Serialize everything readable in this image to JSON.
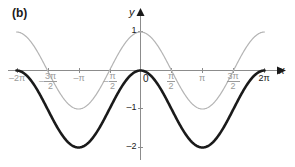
{
  "figure": {
    "panel_label": "(b)",
    "x_axis_label": "x",
    "y_axis_label": "y"
  },
  "chart_data": {
    "type": "line",
    "title": "",
    "xlabel": "x",
    "ylabel": "y",
    "xlim": [
      -7.2,
      7.6
    ],
    "ylim": [
      -2.35,
      1.35
    ],
    "grid": false,
    "legend": "none",
    "x_tick_labels": [
      "-2π",
      "-3π/2",
      "-π",
      "-π/2",
      "0",
      "π/2",
      "π",
      "3π/2",
      "2π"
    ],
    "x_tick_values": [
      -6.283,
      -4.712,
      -3.142,
      -1.571,
      0,
      1.571,
      3.142,
      4.712,
      6.283
    ],
    "y_tick_labels": [
      "1",
      "-1",
      "-2"
    ],
    "y_tick_values": [
      1,
      -1,
      -2
    ],
    "series": [
      {
        "name": "y = cos x",
        "color": "#b4b4b4",
        "width": 1.2,
        "style": "solid",
        "formula": "cos",
        "amplitude": 1,
        "offset": 0,
        "x": [
          -6.283,
          -5.498,
          -4.712,
          -3.927,
          -3.142,
          -2.356,
          -1.571,
          -0.785,
          0,
          0.785,
          1.571,
          2.356,
          3.142,
          3.927,
          4.712,
          5.498,
          6.283
        ],
        "values": [
          1,
          0.707,
          0,
          -0.707,
          -1,
          -0.707,
          0,
          0.707,
          1,
          0.707,
          0,
          -0.707,
          -1,
          -0.707,
          0,
          0.707,
          1
        ]
      },
      {
        "name": "y = cos x - 1",
        "color": "#1a1a1a",
        "width": 2.6,
        "style": "solid",
        "formula": "cos",
        "amplitude": 1,
        "offset": -1,
        "x": [
          -6.283,
          -5.498,
          -4.712,
          -3.927,
          -3.142,
          -2.356,
          -1.571,
          -0.785,
          0,
          0.785,
          1.571,
          2.356,
          3.142,
          3.927,
          4.712,
          5.498,
          6.283
        ],
        "values": [
          0,
          -0.293,
          -1,
          -1.707,
          -2,
          -1.707,
          -1,
          -0.293,
          0,
          -0.293,
          -1,
          -1.707,
          -2,
          -1.707,
          -1,
          -0.293,
          0
        ]
      }
    ],
    "axis_color": "#8c8c8c",
    "axis_arrow_color": "#1a1a1a",
    "tick_label_color": "#9a9a9a",
    "origin_label": "0"
  },
  "x_ticks": [
    {
      "label": "-2π",
      "kind": "plain",
      "lead": "–2π",
      "num": "",
      "den": "",
      "dark": false,
      "px": 17
    },
    {
      "label": "-3π/2",
      "kind": "frac",
      "lead": "–",
      "num": "3π",
      "den": "2",
      "dark": false,
      "px": 48
    },
    {
      "label": "-π",
      "kind": "plain",
      "lead": "–π",
      "num": "",
      "den": "",
      "dark": false,
      "px": 79
    },
    {
      "label": "-π/2",
      "kind": "frac",
      "lead": "–",
      "num": "π",
      "den": "2",
      "dark": false,
      "px": 110
    },
    {
      "label": "π/2",
      "kind": "frac",
      "lead": "",
      "num": "π",
      "den": "2",
      "dark": false,
      "px": 171
    },
    {
      "label": "π",
      "kind": "plain",
      "lead": "π",
      "num": "",
      "den": "",
      "dark": false,
      "px": 202
    },
    {
      "label": "3π/2",
      "kind": "frac",
      "lead": "",
      "num": "3π",
      "den": "2",
      "dark": false,
      "px": 233
    },
    {
      "label": "2π",
      "kind": "plain",
      "lead": "2π",
      "num": "",
      "den": "",
      "dark": true,
      "px": 264
    }
  ],
  "y_ticks": [
    {
      "label": "1",
      "px": 31
    },
    {
      "label": "–1",
      "px": 108
    },
    {
      "label": "–2",
      "px": 147
    }
  ],
  "origin": {
    "label": "0",
    "x": 143,
    "y": 74
  }
}
